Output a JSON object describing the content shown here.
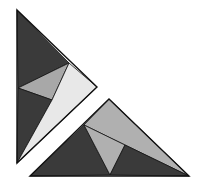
{
  "figure": {
    "colors": {
      "background": "#ffffff",
      "dark": "#3a3a3a",
      "medium": "#a8a8a8",
      "medium_lower": "#b0b0b0",
      "light": "#e8e8e8",
      "stroke": "#111111"
    },
    "upper_triangle": {
      "vertices": [
        [
          17,
          10
        ],
        [
          97,
          87
        ],
        [
          17,
          163
        ]
      ],
      "pieces": [
        {
          "name": "top-dark",
          "fill": "dark",
          "points": "17,10 69,63 18,88"
        },
        {
          "name": "middle-grey",
          "fill": "medium",
          "points": "18,88 69,63 52,100"
        },
        {
          "name": "lower-dark",
          "fill": "dark",
          "points": "18,88 52,100 17,163"
        },
        {
          "name": "light-strip",
          "fill": "light",
          "points": "69,63 97,87 17,163 52,100"
        }
      ]
    },
    "lower_triangle": {
      "vertices": [
        [
          109,
          99
        ],
        [
          189,
          176
        ],
        [
          30,
          176
        ]
      ],
      "pieces": [
        {
          "name": "top-grey",
          "fill": "medium_lower",
          "points": "109,99 189,176 125,145 84,125"
        },
        {
          "name": "left-dark",
          "fill": "dark",
          "points": "84,125 110,175 30,176"
        },
        {
          "name": "center-grey",
          "fill": "medium_lower",
          "points": "84,125 125,145 110,175"
        },
        {
          "name": "right-dark",
          "fill": "dark",
          "points": "125,145 189,176 110,175"
        }
      ]
    }
  }
}
